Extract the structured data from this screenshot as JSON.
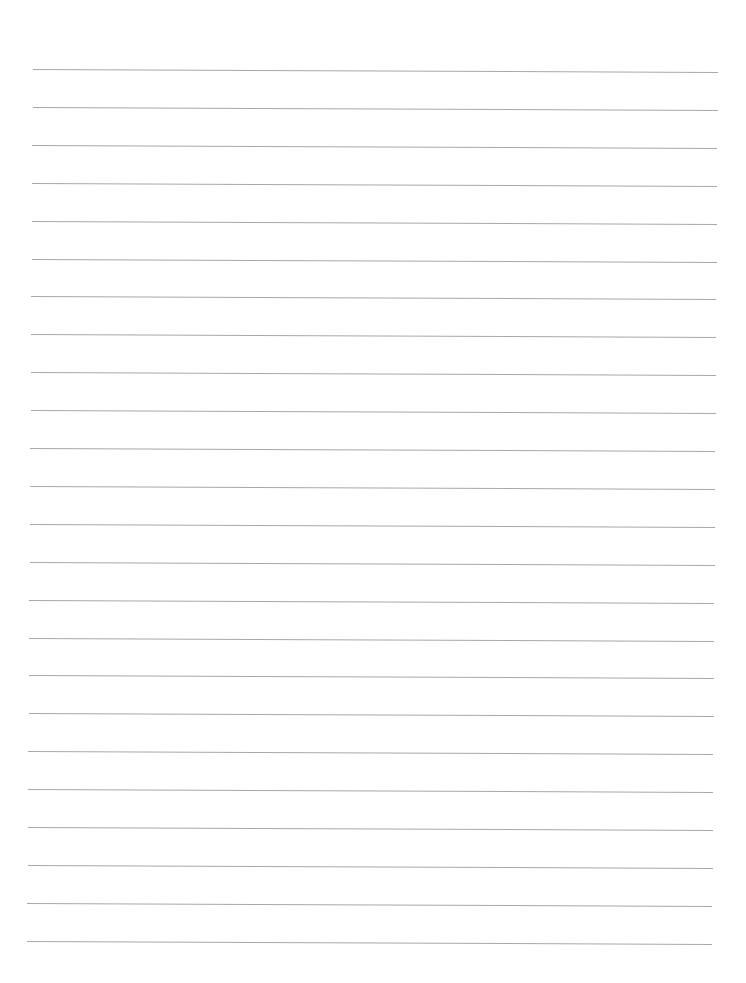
{
  "page": {
    "type": "lined-paper",
    "background_color": "#ffffff",
    "line_color": "#a8a8a8",
    "line_count": 24,
    "first_line_y": 69,
    "line_spacing": 37.9,
    "content": ""
  }
}
